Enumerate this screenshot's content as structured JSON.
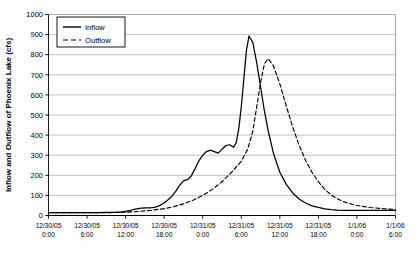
{
  "chart_data": {
    "type": "line",
    "title": "",
    "xlabel": "",
    "ylabel": "Inflow and Outflow of Phoenix Lake (cfs)",
    "ylim": [
      0,
      1000
    ],
    "ytick_values": [
      0,
      100,
      200,
      300,
      400,
      500,
      600,
      700,
      800,
      900,
      1000
    ],
    "ytick_labels": [
      "0",
      "100",
      "200",
      "300",
      "400",
      "500",
      "600",
      "700",
      "800",
      "900",
      "1000"
    ],
    "grid": true,
    "grid_axis": "y",
    "legend_position": "top-left-inside",
    "xtick_labels": [
      {
        "date": "12/30/05",
        "time": "0:00"
      },
      {
        "date": "12/30/05",
        "time": "6:00"
      },
      {
        "date": "12/30/05",
        "time": "12:00"
      },
      {
        "date": "12/30/05",
        "time": "18:00"
      },
      {
        "date": "12/31/05",
        "time": "0:00"
      },
      {
        "date": "12/31/05",
        "time": "6:00"
      },
      {
        "date": "12/31/05",
        "time": "12:00"
      },
      {
        "date": "12/31/05",
        "time": "18:00"
      },
      {
        "date": "1/1/06",
        "time": "0:00"
      },
      {
        "date": "1/1/06",
        "time": "6:00"
      }
    ],
    "x_hours": [
      0,
      6,
      12,
      18,
      24,
      30,
      36,
      42,
      48,
      54
    ],
    "xlim_hours": [
      0,
      54
    ],
    "series": [
      {
        "name": "Inflow",
        "style": "solid",
        "color": "#000000",
        "x_hours": [
          0,
          1.5,
          3,
          4.5,
          6,
          7.5,
          9,
          10.5,
          11.5,
          12,
          12.8,
          13.5,
          14.2,
          15,
          15.8,
          16.5,
          17.2,
          18,
          18.6,
          19.2,
          19.8,
          20.4,
          21,
          21.6,
          22.2,
          22.8,
          23.4,
          24,
          24.6,
          25.2,
          25.8,
          26.4,
          27,
          27.6,
          28.2,
          28.8,
          29.2,
          29.6,
          30,
          30.4,
          30.8,
          31.2,
          31.8,
          32.4,
          33,
          33.6,
          34.2,
          35,
          36,
          37,
          38,
          39,
          40,
          41,
          42,
          43,
          44,
          45,
          46,
          48,
          50,
          52,
          54
        ],
        "values": [
          14,
          14,
          14,
          14,
          14,
          14,
          15,
          16,
          18,
          21,
          26,
          32,
          36,
          38,
          38,
          40,
          48,
          62,
          78,
          96,
          120,
          150,
          172,
          178,
          196,
          232,
          272,
          300,
          318,
          325,
          318,
          310,
          330,
          348,
          352,
          340,
          360,
          430,
          540,
          680,
          820,
          893,
          860,
          760,
          640,
          520,
          420,
          310,
          215,
          155,
          112,
          82,
          62,
          48,
          40,
          33,
          29,
          27,
          26,
          25,
          25,
          25,
          25
        ]
      },
      {
        "name": "Outflow",
        "style": "dashed",
        "color": "#000000",
        "x_hours": [
          0,
          3,
          6,
          9,
          12,
          14,
          16,
          18,
          19.5,
          21,
          22.5,
          24,
          25.5,
          27,
          28.5,
          30,
          31,
          31.8,
          32.4,
          33,
          33.6,
          34.2,
          35,
          36,
          37,
          38,
          39,
          40,
          41,
          42,
          43,
          44,
          45,
          46,
          47,
          48,
          50,
          52,
          54
        ],
        "values": [
          14,
          14,
          14,
          14,
          16,
          20,
          26,
          34,
          44,
          58,
          76,
          100,
          130,
          168,
          215,
          270,
          330,
          420,
          540,
          660,
          755,
          780,
          745,
          655,
          545,
          440,
          350,
          275,
          215,
          168,
          130,
          102,
          82,
          68,
          58,
          50,
          40,
          34,
          30
        ]
      }
    ]
  },
  "legend": {
    "entries": [
      {
        "label": "Inflow",
        "style": "solid"
      },
      {
        "label": "Outflow",
        "style": "dashed"
      }
    ]
  }
}
